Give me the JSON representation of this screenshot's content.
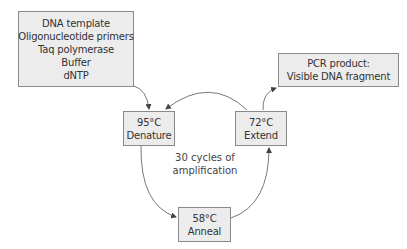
{
  "diagram": {
    "type": "PCR cycle flow diagram",
    "ingredients_box": {
      "lines": [
        "DNA template",
        "Oligonucleotide primers",
        "Taq polymerase",
        "Buffer",
        "dNTP"
      ]
    },
    "product_box": {
      "lines": [
        "PCR product:",
        "Visible DNA fragment"
      ]
    },
    "steps": [
      {
        "id": "denature",
        "temperature": "95°C",
        "label": "Denature"
      },
      {
        "id": "anneal",
        "temperature": "58°C",
        "label": "Anneal"
      },
      {
        "id": "extend",
        "temperature": "72°C",
        "label": "Extend"
      }
    ],
    "cycle_label": {
      "lines": [
        "30 cycles of",
        "amplification"
      ]
    },
    "arrows": [
      {
        "from": "ingredients",
        "to": "denature"
      },
      {
        "from": "denature",
        "to": "anneal"
      },
      {
        "from": "anneal",
        "to": "extend"
      },
      {
        "from": "extend",
        "to": "denature"
      },
      {
        "from": "extend",
        "to": "product"
      }
    ],
    "colors": {
      "box_fill": "#ececec",
      "box_border": "#8a8a8a",
      "arrow": "#444444",
      "text": "#333333"
    }
  }
}
